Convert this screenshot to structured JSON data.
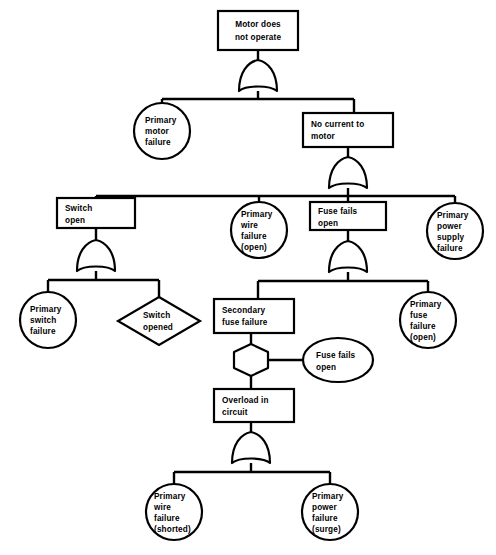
{
  "diagram": {
    "type": "fault-tree",
    "colors": {
      "stroke": "#000000",
      "fill": "#ffffff",
      "background": "#ffffff"
    },
    "nodes": [
      {
        "id": "top-event",
        "shape": "rectangle",
        "name": "top-event-motor-does-not-operate",
        "align": "middle",
        "lines": [
          "Motor does",
          "not operate"
        ]
      },
      {
        "id": "primary-motor-failure",
        "shape": "circle",
        "name": "basic-event-primary-motor-failure",
        "align": "left",
        "lines": [
          "Primary",
          "motor",
          "failure"
        ]
      },
      {
        "id": "no-current-to-motor",
        "shape": "rectangle",
        "name": "intermediate-event-no-current-to-motor",
        "align": "left",
        "lines": [
          "No current to",
          "motor"
        ]
      },
      {
        "id": "switch-open",
        "shape": "rectangle",
        "name": "intermediate-event-switch-open",
        "align": "left",
        "lines": [
          "Switch",
          "open"
        ]
      },
      {
        "id": "primary-wire-failure-open",
        "shape": "circle",
        "name": "basic-event-primary-wire-failure-open",
        "align": "left",
        "lines": [
          "Primary",
          "wire",
          "failure",
          "(open)"
        ]
      },
      {
        "id": "fuse-fails-open-box",
        "shape": "rectangle",
        "name": "intermediate-event-fuse-fails-open",
        "align": "left",
        "lines": [
          "Fuse fails",
          "open"
        ]
      },
      {
        "id": "primary-power-supply-failure",
        "shape": "circle",
        "name": "basic-event-primary-power-supply-failure",
        "align": "left",
        "lines": [
          "Primary",
          "power",
          "supply",
          "failure"
        ]
      },
      {
        "id": "primary-switch-failure",
        "shape": "circle",
        "name": "basic-event-primary-switch-failure",
        "align": "left",
        "lines": [
          "Primary",
          "switch",
          "failure"
        ]
      },
      {
        "id": "switch-opened",
        "shape": "diamond",
        "name": "undeveloped-event-switch-opened",
        "align": "left",
        "lines": [
          "Switch",
          "opened"
        ]
      },
      {
        "id": "secondary-fuse-failure",
        "shape": "rectangle",
        "name": "intermediate-event-secondary-fuse-failure",
        "align": "left",
        "lines": [
          "Secondary",
          "fuse failure"
        ]
      },
      {
        "id": "fuse-fails-open-ellipse",
        "shape": "ellipse",
        "name": "conditioning-event-fuse-fails-open",
        "align": "left",
        "lines": [
          "Fuse fails",
          "open"
        ]
      },
      {
        "id": "primary-fuse-failure-open",
        "shape": "circle",
        "name": "basic-event-primary-fuse-failure-open",
        "align": "left",
        "lines": [
          "Primary",
          "fuse",
          "failure",
          "(open)"
        ]
      },
      {
        "id": "overload-in-circuit",
        "shape": "rectangle",
        "name": "intermediate-event-overload-in-circuit",
        "align": "left",
        "lines": [
          "Overload in",
          "circuit"
        ]
      },
      {
        "id": "primary-wire-failure-shorted",
        "shape": "circle",
        "name": "basic-event-primary-wire-failure-shorted",
        "align": "left",
        "lines": [
          "Primary",
          "wire",
          "failure",
          "(shorted)"
        ]
      },
      {
        "id": "primary-power-failure-surge",
        "shape": "circle",
        "name": "basic-event-primary-power-failure-surge",
        "align": "left",
        "lines": [
          "Primary",
          "power",
          "failure",
          "(surge)"
        ]
      }
    ],
    "gates": [
      {
        "id": "gate-top",
        "type": "or",
        "name": "or-gate-top-event"
      },
      {
        "id": "gate-no-current",
        "type": "or",
        "name": "or-gate-no-current-to-motor"
      },
      {
        "id": "gate-switch-open",
        "type": "or",
        "name": "or-gate-switch-open"
      },
      {
        "id": "gate-fuse-fails",
        "type": "or",
        "name": "or-gate-fuse-fails-open"
      },
      {
        "id": "gate-inhibit",
        "type": "inhibit",
        "name": "inhibit-gate-secondary-fuse-failure"
      },
      {
        "id": "gate-overload",
        "type": "or",
        "name": "or-gate-overload-in-circuit"
      }
    ]
  }
}
